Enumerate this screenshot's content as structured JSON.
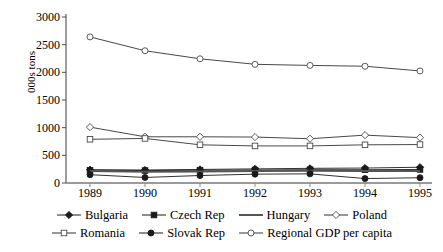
{
  "chart_data": {
    "type": "line",
    "title": "",
    "xlabel": "",
    "ylabel": "000s tons",
    "categories": [
      "1989",
      "1990",
      "1991",
      "1992",
      "1993",
      "1994",
      "1995"
    ],
    "ylim": [
      0,
      3000
    ],
    "ytick_values": [
      0,
      500,
      1000,
      1500,
      2000,
      2500,
      3000
    ],
    "ytick_labels": [
      "0",
      "500",
      "1000",
      "1500",
      "2000",
      "2500",
      "3000"
    ],
    "grid": false,
    "legend_position": "bottom",
    "series": [
      {
        "name": "Bulgaria",
        "marker": "filled-diamond",
        "color": "#1a1a1a",
        "values": [
          240,
          235,
          245,
          255,
          265,
          270,
          285
        ]
      },
      {
        "name": "Czech Rep",
        "marker": "filled-square",
        "color": "#1a1a1a",
        "values": [
          230,
          225,
          230,
          235,
          240,
          240,
          245
        ]
      },
      {
        "name": "Hungary",
        "marker": "none",
        "color": "#555555",
        "values": [
          215,
          205,
          210,
          215,
          220,
          215,
          215
        ]
      },
      {
        "name": "Poland",
        "marker": "open-diamond",
        "color": "#333333",
        "values": [
          1010,
          835,
          835,
          830,
          800,
          865,
          820
        ]
      },
      {
        "name": "Romania",
        "marker": "open-square",
        "color": "#333333",
        "values": [
          790,
          805,
          690,
          670,
          670,
          690,
          695
        ]
      },
      {
        "name": "Slovak Rep",
        "marker": "filled-circle",
        "color": "#1a1a1a",
        "values": [
          150,
          100,
          135,
          160,
          165,
          80,
          95
        ]
      },
      {
        "name": "Regional GDP per capita",
        "marker": "open-circle",
        "color": "#333333",
        "values": [
          2640,
          2390,
          2245,
          2145,
          2125,
          2110,
          2025
        ]
      }
    ]
  },
  "legend": {
    "rows": [
      [
        "Bulgaria",
        "Czech Rep",
        "Hungary",
        "Poland"
      ],
      [
        "Romania",
        "Slovak Rep",
        "Regional GDP per capita"
      ]
    ]
  }
}
